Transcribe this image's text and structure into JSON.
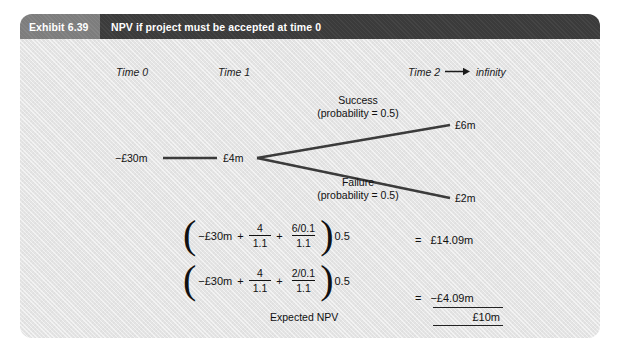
{
  "exhibit": {
    "number": "Exhibit 6.39",
    "title": "NPV if project must be accepted at time 0"
  },
  "timeline": {
    "time_0": "Time 0",
    "time_1": "Time 1",
    "time_2": "Time 2",
    "arrow": "→",
    "infinity": "infinity"
  },
  "tree": {
    "initial_investment": "−£30m",
    "time1_cash_flow": "£4m",
    "success": {
      "label": "Success",
      "probability_text": "(probability = 0.5)",
      "value": "£6m"
    },
    "failure": {
      "label": "Failure",
      "probability_text": "(probability = 0.5)",
      "value": "£2m"
    },
    "line_color": "#3b3b3b"
  },
  "equations": [
    {
      "open_paren": "(",
      "term1": "−£30m",
      "plus1": "+",
      "frac1_num": "4",
      "frac1_den": "1.1",
      "plus2": "+",
      "frac2_num": "6/0.1",
      "frac2_den": "1.1",
      "close_paren": ")",
      "multiplier": "0.5",
      "equals": "=",
      "result": "£14.09m"
    },
    {
      "open_paren": "(",
      "term1": "−£30m",
      "plus1": "+",
      "frac1_num": "4",
      "frac1_den": "1.1",
      "plus2": "+",
      "frac2_num": "2/0.1",
      "frac2_den": "1.1",
      "close_paren": ")",
      "multiplier": "0.5",
      "equals": "=",
      "result": "−£4.09m"
    }
  ],
  "summary": {
    "expected_npv_label": "Expected NPV",
    "total_value": "£10m"
  },
  "colors": {
    "card_background": "#e4e4e4",
    "header_number_bg": "#7d7d7d",
    "header_title_bg": "#3b3b3b",
    "header_text": "#ffffff",
    "body_text": "#111111"
  }
}
